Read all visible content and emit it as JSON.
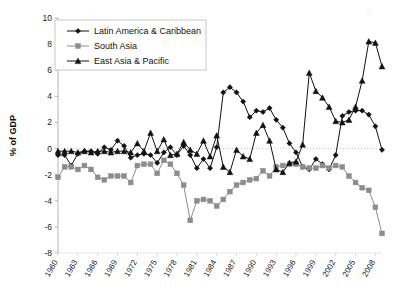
{
  "chart_data": {
    "type": "line",
    "title": "",
    "xlabel": "",
    "ylabel": "% of GDP",
    "ylim": [
      -8,
      10
    ],
    "xlim": [
      1960,
      2009
    ],
    "y_ticks": [
      10,
      8,
      6,
      4,
      2,
      0,
      -2,
      -4,
      -6,
      -8
    ],
    "x_ticks": [
      1960,
      1963,
      1966,
      1969,
      1972,
      1975,
      1978,
      1981,
      1984,
      1987,
      1990,
      1993,
      1996,
      1999,
      2002,
      2005,
      2008
    ],
    "grid": false,
    "legend_position": "top-left",
    "x": [
      1960,
      1961,
      1962,
      1963,
      1964,
      1965,
      1966,
      1967,
      1968,
      1969,
      1970,
      1971,
      1972,
      1973,
      1974,
      1975,
      1976,
      1977,
      1978,
      1979,
      1980,
      1981,
      1982,
      1983,
      1984,
      1985,
      1986,
      1987,
      1988,
      1989,
      1990,
      1991,
      1992,
      1993,
      1994,
      1995,
      1996,
      1997,
      1998,
      1999,
      2000,
      2001,
      2002,
      2003,
      2004,
      2005,
      2006,
      2007,
      2008,
      2009
    ],
    "series": [
      {
        "name": "Latin America & Caribbean",
        "color": "#111111",
        "marker": "diamond",
        "values": [
          -0.5,
          -0.5,
          -1.3,
          -0.4,
          -0.2,
          -0.2,
          -0.4,
          0.1,
          -0.1,
          0.6,
          0.2,
          -0.7,
          -0.5,
          -0.4,
          -0.5,
          -1.1,
          -0.3,
          0.1,
          -0.5,
          0.2,
          -0.5,
          -1.5,
          -0.8,
          -1.5,
          0.1,
          4.3,
          4.7,
          4.3,
          3.6,
          2.4,
          2.9,
          2.8,
          3.1,
          2.2,
          1.6,
          0.4,
          -0.3,
          -1.4,
          -1.6,
          -0.8,
          -1.2,
          -1.6,
          -0.5,
          2.5,
          2.8,
          2.9,
          2.9,
          2.6,
          1.7,
          -0.1
        ]
      },
      {
        "name": "South Asia",
        "color": "#8c8c8c",
        "marker": "square",
        "values": [
          -2.2,
          -1.4,
          -1.4,
          -1.6,
          -1.3,
          -1.6,
          -2.2,
          -2.4,
          -2.1,
          -2.1,
          -2.1,
          -2.6,
          -1.3,
          -1.2,
          -1.2,
          -1.9,
          -0.9,
          -1.2,
          -1.9,
          -2.8,
          -5.5,
          -4.0,
          -3.9,
          -4.0,
          -4.4,
          -3.9,
          -3.3,
          -2.8,
          -2.6,
          -2.4,
          -2.3,
          -1.7,
          -2.1,
          -1.4,
          -1.3,
          -1.2,
          -1.2,
          -1.4,
          -1.5,
          -1.5,
          -1.3,
          -1.5,
          -1.3,
          -1.4,
          -2.1,
          -2.6,
          -3.0,
          -3.2,
          -4.5,
          -6.5
        ]
      },
      {
        "name": "East Asia & Pacific",
        "color": "#111111",
        "marker": "triangle",
        "values": [
          -0.2,
          -0.2,
          -0.2,
          -0.3,
          -0.2,
          -0.3,
          -0.2,
          -0.2,
          -0.3,
          -0.2,
          -0.2,
          -0.3,
          0.4,
          -0.2,
          1.2,
          -0.2,
          0.7,
          -0.5,
          -0.4,
          0.5,
          -0.1,
          -0.4,
          0.6,
          -0.6,
          1.0,
          -1.4,
          -1.8,
          -0.1,
          -0.6,
          -0.8,
          1.2,
          1.8,
          0.6,
          -1.6,
          -1.8,
          -1.1,
          -1.0,
          0.3,
          5.8,
          4.4,
          3.9,
          3.2,
          2.1,
          2.0,
          2.2,
          3.2,
          5.2,
          8.2,
          8.1,
          6.3
        ]
      }
    ]
  },
  "legend": {
    "items": [
      {
        "label": "Latin America & Caribbean"
      },
      {
        "label": "South Asia"
      },
      {
        "label": "East Asia & Pacific"
      }
    ]
  },
  "axis": {
    "y_title": "% of GDP"
  }
}
